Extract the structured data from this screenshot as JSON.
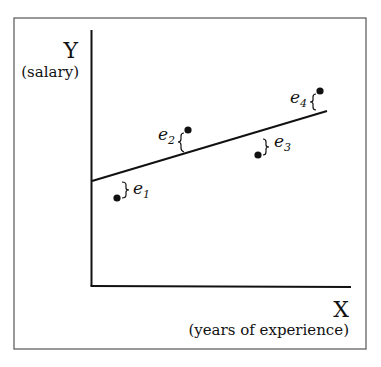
{
  "figure": {
    "y_axis": {
      "letter": "Y",
      "description": "(salary)"
    },
    "x_axis": {
      "letter": "X",
      "description": "(years of experience)"
    },
    "regression_line": {
      "x1": 92,
      "y1": 181,
      "x2": 327,
      "y2": 111
    },
    "points": [
      {
        "id": "1",
        "label": "e",
        "sub": "1",
        "x": 117,
        "y": 198
      },
      {
        "id": "2",
        "label": "e",
        "sub": "2",
        "x": 188,
        "y": 130
      },
      {
        "id": "3",
        "label": "e",
        "sub": "3",
        "x": 258,
        "y": 155
      },
      {
        "id": "4",
        "label": "e",
        "sub": "4",
        "x": 320,
        "y": 91
      }
    ]
  }
}
